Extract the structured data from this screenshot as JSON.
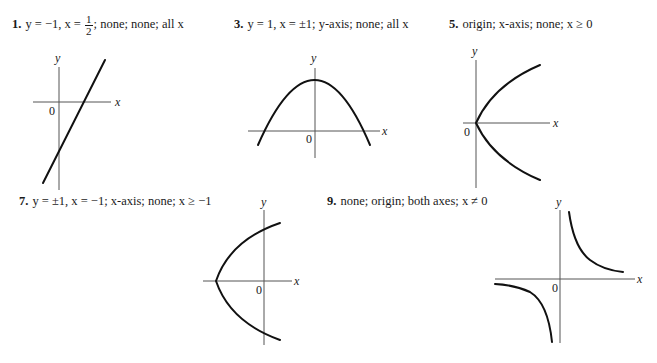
{
  "answers": [
    {
      "number": "1.",
      "text_before_frac": "y = −1, x = ",
      "frac_num": "1",
      "frac_den": "2",
      "text_after_frac": "; none; none; all x",
      "graph": {
        "type": "line",
        "axis_labels": {
          "x": "x",
          "y": "y",
          "origin": "0"
        },
        "description": "straight line with positive slope crossing x-axis right of origin"
      }
    },
    {
      "number": "3.",
      "text": "y = 1, x = ±1; y-axis; none; all x",
      "graph": {
        "type": "parabola-down",
        "axis_labels": {
          "x": "x",
          "y": "y",
          "origin": "0"
        },
        "description": "downward-opening parabola symmetric about y-axis"
      }
    },
    {
      "number": "5.",
      "text": "origin; x-axis; none; x ≥ 0",
      "graph": {
        "type": "parabola-right",
        "axis_labels": {
          "x": "x",
          "y": "y",
          "origin": "0"
        },
        "description": "right-opening parabola with vertex at origin"
      }
    },
    {
      "number": "7.",
      "text": "y = ±1, x = −1; x-axis; none; x ≥ −1",
      "graph": {
        "type": "parabola-right-shifted",
        "axis_labels": {
          "x": "x",
          "y": "y",
          "origin": "0"
        },
        "description": "right-opening parabola with vertex left of origin"
      }
    },
    {
      "number": "9.",
      "text": "none; origin; both axes; x ≠ 0",
      "graph": {
        "type": "hyperbola",
        "axis_labels": {
          "x": "x",
          "y": "y",
          "origin": "0"
        },
        "description": "hyperbola branches in quadrants I and III"
      }
    }
  ]
}
